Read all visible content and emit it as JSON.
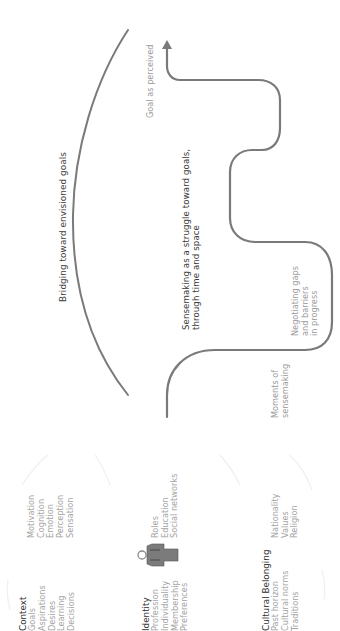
{
  "diagram": {
    "colors": {
      "stroke": "#7a7a7a",
      "text_dark": "#3a3a3a",
      "text_muted": "#9a9a9a",
      "figure": "#7b7b7b",
      "faint": "#eeeeee"
    },
    "arc_label": "Bridging toward envisioned goals",
    "path_label": {
      "line1": "Sensemaking as a struggle toward goals,",
      "line2": "through time and space"
    },
    "goal_label": "Goal as perceived",
    "negotiating_label": {
      "line1": "Negotiating gaps",
      "line2": "and barriers",
      "line3": "in progress"
    },
    "moments_label": {
      "line1": "Moments of",
      "line2": "sensemaking"
    },
    "context": {
      "title": "Context",
      "items": [
        "Goals",
        "Aspirations",
        "Desires",
        "Learning",
        "Decisions"
      ],
      "related": [
        "Motivation",
        "Cognition",
        "Emotion",
        "Perception",
        "Sensation"
      ]
    },
    "identity": {
      "title": "Identity",
      "items": [
        "Profession",
        "Individuality",
        "Membership",
        "Preferences"
      ],
      "related": [
        "Roles",
        "Education",
        "Social networks"
      ],
      "icon": "person-icon"
    },
    "cultural": {
      "title": "Cultural Belonging",
      "items": [
        "Past horizon",
        "Cultural norms",
        "Traditions"
      ],
      "related": [
        "Nationality",
        "Values",
        "Religion"
      ]
    }
  }
}
